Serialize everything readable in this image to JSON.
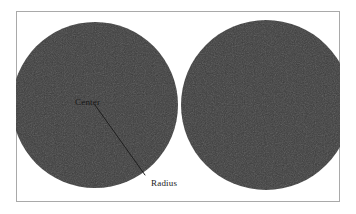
{
  "figure": {
    "background_color": "#ffffff",
    "frame": {
      "x": 16,
      "y": 11,
      "width": 324,
      "height": 191,
      "border_color": "#a9a9a9",
      "border_width": 1,
      "fill_color": "#ffffff"
    },
    "shape_fill_color": "#3c3c3c",
    "shape_noise_color": "#454545",
    "line_color": "#1e1e1e",
    "label_color_on_dark": "#151515",
    "label_color_on_light": "#1a1a1a"
  },
  "circles": [
    {
      "name": "left-circle",
      "cx": 95,
      "cy": 105,
      "r": 83
    },
    {
      "name": "right-circle",
      "cx": 266,
      "cy": 105,
      "r": 85
    }
  ],
  "radius_line": {
    "x1": 95,
    "y1": 105,
    "x2": 145,
    "y2": 175,
    "width": 1
  },
  "labels": {
    "center": {
      "text": "Center",
      "x": 75,
      "y": 105,
      "font_size": 9
    },
    "radius": {
      "text": "Radius",
      "x": 151,
      "y": 186,
      "font_size": 9
    }
  }
}
